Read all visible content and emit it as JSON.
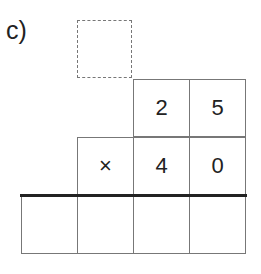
{
  "problem": {
    "label": "c)",
    "carry_box": "",
    "row1": [
      "",
      "",
      "2",
      "5"
    ],
    "row2": [
      "",
      "×",
      "4",
      "0"
    ],
    "answer_row": [
      "",
      "",
      "",
      ""
    ]
  }
}
